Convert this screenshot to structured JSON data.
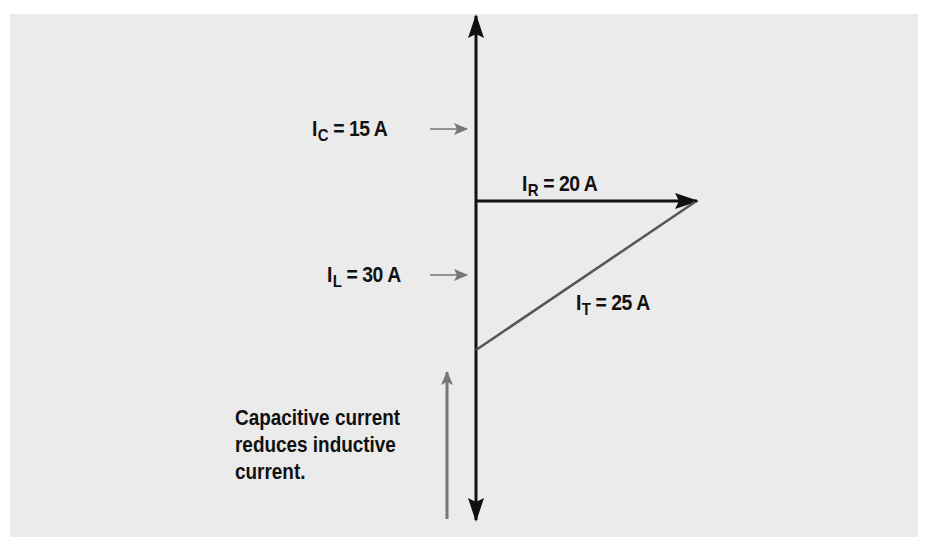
{
  "diagram": {
    "type": "phasor-diagram",
    "labels": {
      "ic": {
        "symbol": "I",
        "subscript": "C",
        "equals": "= 15 A"
      },
      "ir": {
        "symbol": "I",
        "subscript": "R",
        "equals": "= 20 A"
      },
      "il": {
        "symbol": "I",
        "subscript": "L",
        "equals": "= 30 A"
      },
      "it": {
        "symbol": "I",
        "subscript": "T",
        "equals": "= 25 A"
      }
    },
    "note": "Capacitive current reduces inductive current.",
    "colors": {
      "panel_background": "#ebebeb",
      "axis": "#111111",
      "resultant": "#555555",
      "pointer_arrow": "#777777"
    }
  }
}
